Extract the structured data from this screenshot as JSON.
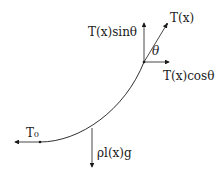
{
  "diagram": {
    "labels": {
      "tension_total": "T(x)",
      "tension_vertical": "T(x)sinθ",
      "tension_horizontal": "T(x)cosθ",
      "angle": "θ",
      "tension_bottom": "T₀",
      "weight": "ρl(x)g"
    },
    "points": {
      "top": [
        144,
        62
      ],
      "bottom": [
        40,
        142
      ]
    },
    "colors": {
      "stroke": "#1a1a1a",
      "background": "#ffffff"
    }
  }
}
